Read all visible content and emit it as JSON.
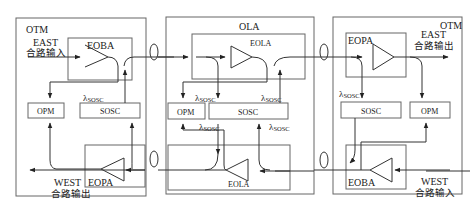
{
  "nodes": {
    "otm_left": {
      "title": "OTM",
      "east_input": {
        "line1": "EAST",
        "line2": "合路输入"
      },
      "west_output": {
        "line1": "WEST",
        "line2": "合路输出"
      },
      "amp_top": "EOBA",
      "amp_bottom": "EOPA",
      "opm": "OPM",
      "sosc": "SOSC",
      "lambda_label": "λ",
      "lambda_sub": "SOSC"
    },
    "ola": {
      "title": "OLA",
      "amp_top": "EOLA",
      "amp_bottom": "EOLA",
      "opm": "OPM",
      "sosc": "SOSC",
      "lambda_label": "λ",
      "lambda_sub": "SOSC"
    },
    "otm_right": {
      "title": "OTM",
      "east_output": {
        "line1": "EAST",
        "line2": "合路输出"
      },
      "west_input": {
        "line1": "WEST",
        "line2": "合路输入"
      },
      "amp_top": "EOPA",
      "amp_bottom": "EOBA",
      "opm": "OPM",
      "sosc": "SOSC",
      "lambda_label": "λ",
      "lambda_sub": "SOSC"
    }
  },
  "colors": {
    "line": "#444444",
    "box": "#555555",
    "background": "#ffffff"
  }
}
